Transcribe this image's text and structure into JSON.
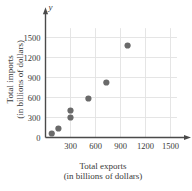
{
  "chart_data": {
    "type": "scatter",
    "title": "",
    "xlabel": "Total exports (in billions of dollars)",
    "ylabel": "Total imports (in billions of dollars)",
    "xlabel_lines": [
      "Total exports",
      "(in billions of dollars)"
    ],
    "ylabel_lines": [
      "Total imports",
      "(in billions of dollars)"
    ],
    "axis_letter_x": "x",
    "axis_letter_y": "y",
    "xlim": [
      0,
      1650
    ],
    "ylim": [
      0,
      1700
    ],
    "xticks": [
      300,
      600,
      900,
      1200,
      1500
    ],
    "yticks": [
      0,
      300,
      600,
      900,
      1200,
      1500
    ],
    "xtick_labels": [
      "300",
      "600",
      "900",
      "1200",
      "1500"
    ],
    "ytick_labels": [
      "0",
      "300",
      "600",
      "900",
      "1200",
      "1500"
    ],
    "grid": true,
    "grid_color": "#e2e2e2",
    "axis_color": "#4a4a4a",
    "legend": "none",
    "marker_color": "#6a6a6a",
    "marker_size": 3.1,
    "points": [
      {
        "x": 75,
        "y": 60
      },
      {
        "x": 155,
        "y": 135
      },
      {
        "x": 300,
        "y": 300
      },
      {
        "x": 300,
        "y": 405
      },
      {
        "x": 515,
        "y": 585
      },
      {
        "x": 730,
        "y": 825
      },
      {
        "x": 985,
        "y": 1380
      }
    ]
  }
}
